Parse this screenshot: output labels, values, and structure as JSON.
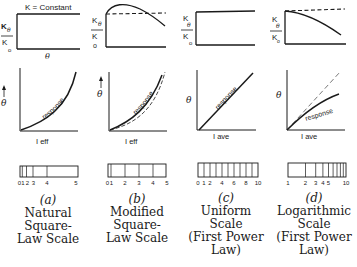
{
  "panels": [
    {
      "id": "a",
      "letter": "(a)",
      "caption": [
        "Natural",
        "Square-",
        "Law Scale"
      ],
      "sensitivity_plot": {
        "y_label_num": "K",
        "y_label_num_sub": "θ",
        "y_label_den": "K",
        "y_label_den_sub": "o",
        "x_label": "θ",
        "annotation": "K = Constant",
        "curve": "constant"
      },
      "response_plot": {
        "y_label": "θ",
        "x_label": "I eff",
        "curve_label": "response",
        "curve": "square-law"
      },
      "scale_ticks": [
        "0",
        "1",
        "2",
        "3",
        "4",
        "5"
      ]
    },
    {
      "id": "b",
      "letter": "(b)",
      "caption": [
        "Modified",
        "Square-",
        "Law Scale"
      ],
      "sensitivity_plot": {
        "y_label_num": "K",
        "y_label_num_sub": "θ",
        "y_label_den": "K",
        "y_label_den_sub": "o",
        "curve": "hump-then-decline"
      },
      "response_plot": {
        "y_label": "θ",
        "x_label": "I eff",
        "curve_label": "response",
        "curve": "modified-square-law"
      },
      "scale_ticks": [
        "0",
        "1",
        "2",
        "3",
        "4",
        "5"
      ]
    },
    {
      "id": "c",
      "letter": "(c)",
      "caption": [
        "Uniform",
        "Scale",
        "(First Power",
        "Law)"
      ],
      "sensitivity_plot": {
        "y_label_num": "K",
        "y_label_num_sub": "θ",
        "y_label_den": "K",
        "y_label_den_sub": "o",
        "curve": "constant"
      },
      "response_plot": {
        "y_label": "θ",
        "x_label": "I ave",
        "curve_label": "response",
        "curve": "linear"
      },
      "scale_ticks": [
        "0",
        "1",
        "2",
        "4",
        "6",
        "8",
        "10"
      ]
    },
    {
      "id": "d",
      "letter": "(d)",
      "caption": [
        "Logarithmic",
        "Scale",
        "(First Power",
        "Law)"
      ],
      "sensitivity_plot": {
        "y_label_num": "K",
        "y_label_num_sub": "θ",
        "y_label_den": "K",
        "y_label_den_sub": "o",
        "curve": "declining"
      },
      "response_plot": {
        "y_label": "θ",
        "x_label": "I ave",
        "curve_label": "response",
        "curve": "logarithmic"
      },
      "scale_ticks": [
        "1",
        "2",
        "3",
        "4",
        "5",
        "10"
      ]
    }
  ],
  "colors": {
    "ink": "#1a1a1a",
    "background": "#ffffff",
    "dashed": "#555555"
  }
}
